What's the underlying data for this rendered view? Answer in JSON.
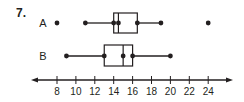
{
  "problem": {
    "number": "7."
  },
  "chart_data": {
    "type": "boxplot",
    "title": "",
    "xlabel": "",
    "ylabel": "",
    "axis": {
      "min_tick": 8,
      "max_tick": 24,
      "tick_step": 2,
      "tick_labels": [
        "8",
        "10",
        "12",
        "14",
        "16",
        "18",
        "20",
        "22",
        "24"
      ],
      "arrows_both_ends": true,
      "grid": false
    },
    "series": [
      {
        "name": "A",
        "min": 11,
        "q1": 14,
        "median": 14.5,
        "q3": 16.5,
        "max": 19,
        "outliers": [
          8,
          24
        ]
      },
      {
        "name": "B",
        "min": 9,
        "q1": 13,
        "median": 15,
        "q3": 16,
        "max": 20,
        "outliers": []
      }
    ]
  },
  "colors": {
    "ink": "#231f20",
    "background": "#ffffff"
  }
}
